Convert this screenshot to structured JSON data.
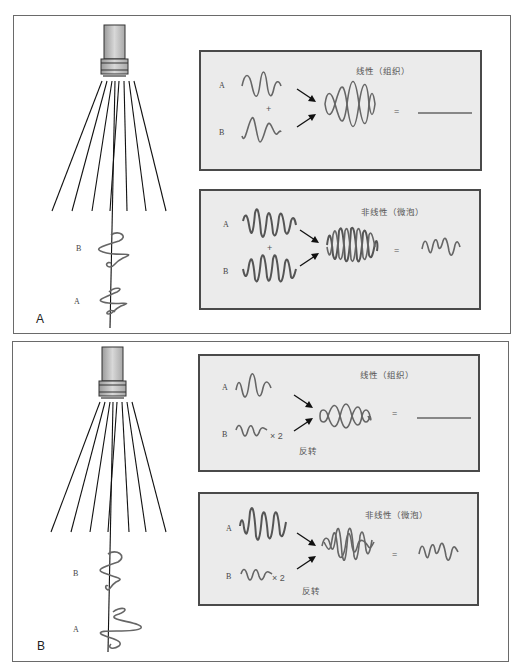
{
  "panels": [
    {
      "letter": "A",
      "beam_labels": {
        "upper": "B",
        "lower": "A"
      },
      "linear": {
        "title": "线性（组织）",
        "input_a": "A",
        "input_b": "B",
        "plus": "+",
        "equals": "=",
        "result": "cancelled (flat line)"
      },
      "nonlinear": {
        "title": "非线性（微泡）",
        "input_a": "A",
        "input_b": "B",
        "plus": "+",
        "equals": "=",
        "result": "residual waveform"
      }
    },
    {
      "letter": "B",
      "beam_labels": {
        "upper": "B",
        "lower": "A"
      },
      "linear": {
        "title": "线性（组织）",
        "input_a": "A",
        "input_b": "B",
        "multiplier": "× 2",
        "invert": "反转",
        "equals": "=",
        "result": "cancelled (flat line)"
      },
      "nonlinear": {
        "title": "非线性（微泡）",
        "input_a": "A",
        "input_b": "B",
        "multiplier": "× 2",
        "invert": "反转",
        "equals": "=",
        "result": "residual waveform"
      }
    }
  ],
  "colors": {
    "box_fill": "#ebebeb",
    "box_border": "#4a4a4a",
    "wave": "#666666",
    "beam": "#111111"
  }
}
